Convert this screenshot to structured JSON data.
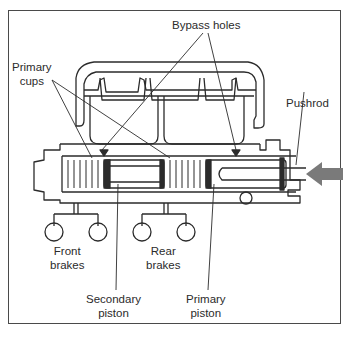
{
  "diagram": {
    "labels": {
      "bypass_holes": "Bypass holes",
      "primary_cups_line1": "Primary",
      "primary_cups_line2": "cups",
      "pushrod": "Pushrod",
      "front_brakes_line1": "Front",
      "front_brakes_line2": "brakes",
      "rear_brakes_line1": "Rear",
      "rear_brakes_line2": "brakes",
      "secondary_piston_line1": "Secondary",
      "secondary_piston_line2": "piston",
      "primary_piston_line1": "Primary",
      "primary_piston_line2": "piston"
    },
    "force_arrow_direction": "left",
    "colors": {
      "line": "#2b2b2b",
      "arrow": "#7a7a7a",
      "frame": "#4a4a4a",
      "background": "#ffffff"
    }
  }
}
